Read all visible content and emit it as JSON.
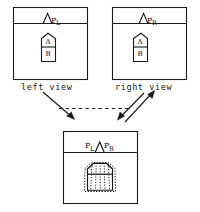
{
  "figure": {
    "type": "line-drawing-diagram",
    "background": "#ffffff",
    "stroke": "#1a1a1a",
    "panels": [
      {
        "id": "left-view",
        "caption": "left view",
        "apex_label": {
          "base": "P",
          "sub": "L"
        },
        "region_labels": [
          "A",
          "B"
        ]
      },
      {
        "id": "right-view",
        "caption": "right view",
        "apex_label": {
          "base": "P",
          "sub": "R"
        },
        "region_labels": [
          "A",
          "B"
        ]
      },
      {
        "id": "merged-view",
        "caption": "",
        "apex_labels": [
          {
            "base": "P",
            "sub": "L"
          },
          {
            "base": "P",
            "sub": "R"
          }
        ],
        "region_labels": []
      }
    ],
    "connectors": [
      {
        "id": "left-to-merged",
        "style": "solid",
        "arrow": "end"
      },
      {
        "id": "right-to-merged",
        "style": "solid",
        "arrow": "end"
      },
      {
        "id": "merged-to-right",
        "style": "solid",
        "arrow": "end"
      },
      {
        "id": "left-right-link",
        "style": "dashed",
        "arrow": "none"
      }
    ]
  }
}
